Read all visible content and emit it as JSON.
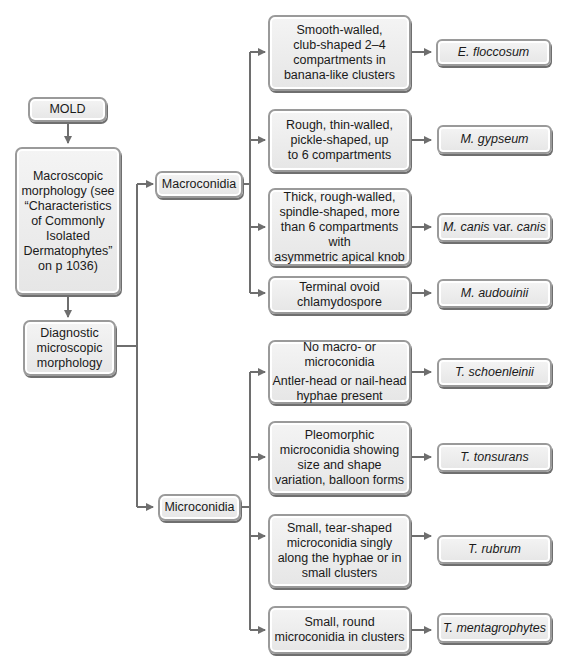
{
  "diagram": {
    "root": "MOLD",
    "macroscopic": [
      "Macroscopic",
      "morphology (see",
      "“Characteristics",
      "of Commonly",
      "Isolated",
      "Dermatophytes”",
      "on p 1036)"
    ],
    "diagnostic": [
      "Diagnostic",
      "microscopic",
      "morphology"
    ],
    "branches": {
      "macroconidia": "Macroconidia",
      "microconidia": "Microconidia"
    },
    "macro_rows": [
      {
        "desc": [
          "Smooth-walled,",
          "club-shaped 2–4",
          "compartments in",
          "banana-like clusters"
        ],
        "organism": "E. floccosum"
      },
      {
        "desc": [
          "Rough, thin-walled,",
          "pickle-shaped, up",
          "to 6 compartments"
        ],
        "organism": "M. gypseum"
      },
      {
        "desc": [
          "Thick, rough-walled,",
          "spindle-shaped, more",
          "than 6 compartments with",
          "asymmetric apical knob"
        ],
        "organism_parts": [
          "M. canis",
          " var. ",
          "canis"
        ]
      },
      {
        "desc": [
          "Terminal ovoid",
          "chlamydospore"
        ],
        "organism": "M. audouinii"
      }
    ],
    "micro_rows": [
      {
        "desc": [
          "No macro- or microconidia",
          "Antler-head or nail-head",
          "hyphae present"
        ],
        "organism": "T. schoenleinii"
      },
      {
        "desc": [
          "Pleomorphic",
          "microconidia showing",
          "size and shape",
          "variation, balloon forms"
        ],
        "organism": "T. tonsurans"
      },
      {
        "desc": [
          "Small, tear-shaped",
          "microconidia singly",
          "along the hyphae or in",
          "small clusters"
        ],
        "organism": "T. rubrum"
      },
      {
        "desc": [
          "Small, round",
          "microconidia in clusters"
        ],
        "organism": "T. mentagrophytes"
      }
    ]
  },
  "colors": {
    "line": "#6e6e6e",
    "box_fill": "#ececec",
    "box_border": "#9a9a9a"
  }
}
